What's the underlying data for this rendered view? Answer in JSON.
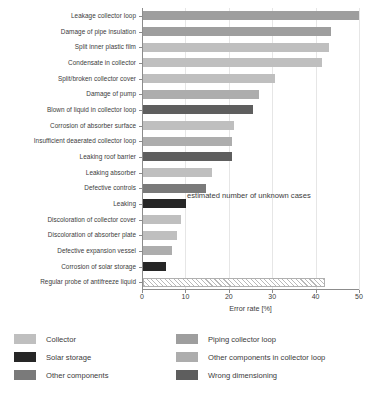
{
  "chart_data": {
    "type": "bar",
    "orientation": "horizontal",
    "title": "",
    "xlabel": "Error rate [%]",
    "ylabel": "",
    "xlim": [
      0,
      50
    ],
    "xticks": [
      0,
      10,
      20,
      30,
      40,
      50
    ],
    "xtick_labels": [
      "0",
      "10",
      "20",
      "30",
      "40",
      "50"
    ],
    "grid": true,
    "grid_axis": "x",
    "legend_position": "below",
    "categories": [
      "Leakage collector loop",
      "Damage of pipe insulation",
      "Split inner plastic film",
      "Condensate in collector",
      "Split/broken collector cover",
      "Damage of pump",
      "Blown of liquid in collector loop",
      "Corrosion of absorber surface",
      "Insufficient deaerated collector loop",
      "Leaking roof barrier",
      "Leaking absorber",
      "Defective controls",
      "Leaking",
      "Discoloration of collector cover",
      "Discoloration of absorber plate",
      "Defective expansion vessel",
      "Corrosion of solar storage",
      "Regular probe of antifreeze liquid"
    ],
    "values": [
      49.8,
      43.4,
      42.8,
      41.2,
      30.5,
      26.8,
      25.4,
      21.0,
      20.6,
      20.4,
      15.8,
      14.6,
      9.8,
      8.8,
      7.8,
      6.6,
      5.4,
      42.0
    ],
    "series_group": [
      "Piping collector loop",
      "Piping collector loop",
      "Collector",
      "Collector",
      "Collector",
      "Other components in collector loop",
      "Wrong dimensioning",
      "Collector",
      "Other components in collector loop",
      "Wrong dimensioning",
      "Collector",
      "Other components",
      "Solar storage",
      "Collector",
      "Collector",
      "Other components in collector loop",
      "Solar storage",
      "estimated unknown cases"
    ],
    "annotation": "estimated number of unknown cases",
    "legend": [
      {
        "label": "Collector",
        "color": "#bfbfbf"
      },
      {
        "label": "Piping collector loop",
        "color": "#9e9e9e"
      },
      {
        "label": "Solar storage",
        "color": "#262626"
      },
      {
        "label": "Other components in collector loop",
        "color": "#adadad"
      },
      {
        "label": "Other components",
        "color": "#7a7a7a"
      },
      {
        "label": "Wrong dimensioning",
        "color": "#5e5e5e"
      }
    ]
  },
  "axis": {
    "x_title": "Error rate [%]",
    "ticks": [
      "0",
      "10",
      "20",
      "30",
      "40",
      "50"
    ]
  },
  "annotation": {
    "text": "estimated number of unknown cases"
  },
  "legend": {
    "col1": [
      {
        "label": "Collector"
      },
      {
        "label": "Solar storage"
      },
      {
        "label": "Other components"
      }
    ],
    "col2": [
      {
        "label": "Piping collector loop"
      },
      {
        "label": "Other components in collector loop"
      },
      {
        "label": "Wrong dimensioning"
      }
    ]
  },
  "caption": {
    "text": ""
  }
}
